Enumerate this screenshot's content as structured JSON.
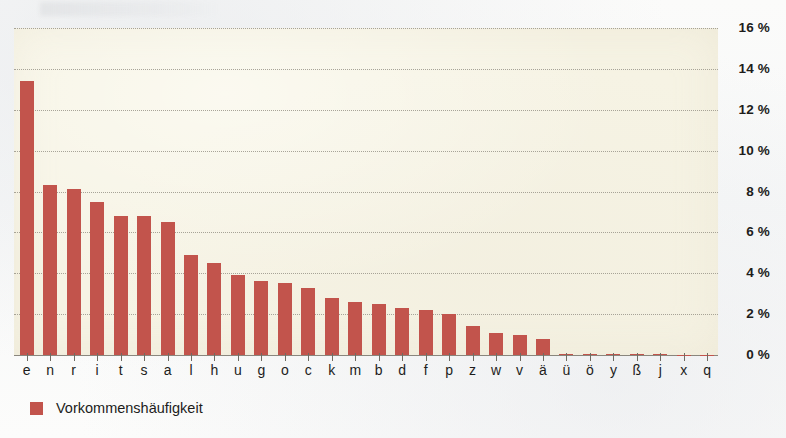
{
  "chart_data": {
    "type": "bar",
    "title": "",
    "xlabel": "",
    "ylabel": "",
    "ylim": [
      0,
      16
    ],
    "y_tick_values": [
      16,
      14,
      12,
      10,
      8,
      6,
      4,
      2,
      0
    ],
    "y_tick_labels": [
      "16 %",
      "14 %",
      "12 %",
      "10 %",
      "8 %",
      "6 %",
      "4 %",
      "2 %",
      "0 %"
    ],
    "grid": true,
    "legend_position": "bottom-left",
    "unit": "%",
    "categories": [
      "e",
      "n",
      "r",
      "i",
      "t",
      "s",
      "a",
      "l",
      "h",
      "u",
      "g",
      "o",
      "c",
      "k",
      "m",
      "b",
      "d",
      "f",
      "p",
      "z",
      "w",
      "v",
      "ä",
      "ü",
      "ö",
      "y",
      "ß",
      "j",
      "x",
      "q"
    ],
    "values": [
      13.4,
      8.3,
      8.1,
      7.5,
      6.8,
      6.8,
      6.5,
      4.9,
      4.5,
      3.9,
      3.6,
      3.5,
      3.3,
      2.8,
      2.6,
      2.5,
      2.3,
      2.2,
      2.0,
      1.4,
      1.1,
      1.0,
      0.8,
      0.07,
      0.05,
      0.04,
      0.03,
      0.03,
      0.02,
      0.02
    ],
    "series": [
      {
        "name": "Vorkommenshäufigkeit",
        "color": "#c2544c",
        "values": [
          13.4,
          8.3,
          8.1,
          7.5,
          6.8,
          6.8,
          6.5,
          4.9,
          4.5,
          3.9,
          3.6,
          3.5,
          3.3,
          2.8,
          2.6,
          2.5,
          2.3,
          2.2,
          2.0,
          1.4,
          1.1,
          1.0,
          0.8,
          0.07,
          0.05,
          0.04,
          0.03,
          0.03,
          0.02,
          0.02
        ]
      }
    ]
  },
  "legend": {
    "items": [
      {
        "label": "Vorkommenshäufigkeit",
        "color": "#c2544c"
      }
    ]
  },
  "colors": {
    "bar": "#c2544c",
    "plot_background": "#f6f3e4",
    "page_background": "#fdfdfb",
    "gridline": "#9a968a",
    "axis": "#6f6c63",
    "text": "#1d1d1b"
  }
}
